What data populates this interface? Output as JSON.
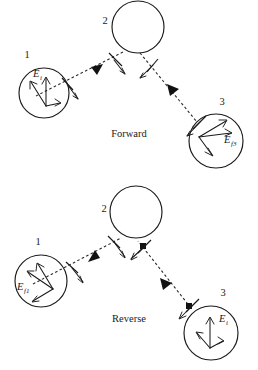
{
  "figure": {
    "title_absent": true,
    "background_color": "#ffffff",
    "line_color": "#1a1a1a",
    "dash_color": "#2b2b2b",
    "panels": [
      {
        "id": "forward",
        "caption": "Forward",
        "caption_pos": {
          "x": 129,
          "y": 137
        },
        "nodes": [
          {
            "id": "n1",
            "label": "1",
            "label_pos": {
              "x": 27,
              "y": 58
            },
            "cx": 44,
            "cy": 93,
            "r": 25,
            "field_label": {
              "base": "E",
              "sub": "i",
              "x": 33,
              "y": 77
            }
          },
          {
            "id": "n2",
            "label": "2",
            "label_pos": {
              "x": 105,
              "y": 24
            },
            "cx": 138,
            "cy": 27,
            "r": 26,
            "field_label": null
          },
          {
            "id": "n3",
            "label": "3",
            "label_pos": {
              "x": 222,
              "y": 105
            },
            "cx": 216,
            "cy": 141,
            "r": 27,
            "field_label": {
              "base": "E",
              "sub": "f3",
              "x": 228,
              "y": 140
            }
          }
        ],
        "rays": [
          {
            "from": "n2",
            "to": "n1",
            "direction": "toward-node-1"
          },
          {
            "from": "n2",
            "to": "n3",
            "direction": "toward-node-3"
          }
        ]
      },
      {
        "id": "reverse",
        "caption": "Reverse",
        "caption_pos": {
          "x": 129,
          "y": 322
        },
        "nodes": [
          {
            "id": "r1",
            "label": "1",
            "label_pos": {
              "x": 38,
              "y": 245
            },
            "cx": 41,
            "cy": 281,
            "r": 26,
            "field_label": {
              "base": "E",
              "sub": "f1",
              "x": 20,
              "y": 288
            }
          },
          {
            "id": "r2",
            "label": "2",
            "label_pos": {
              "x": 104,
              "y": 212
            },
            "cx": 136,
            "cy": 212,
            "r": 26,
            "field_label": null
          },
          {
            "id": "r3",
            "label": "3",
            "label_pos": {
              "x": 223,
              "y": 296
            },
            "cx": 211,
            "cy": 333,
            "r": 27,
            "field_label": {
              "base": "E",
              "sub": "i",
              "x": 222,
              "y": 320
            }
          }
        ],
        "rays": [
          {
            "from": "r1",
            "to": "r2",
            "direction": "toward-node-2"
          },
          {
            "from": "r3",
            "to": "r2",
            "direction": "toward-node-2"
          }
        ]
      }
    ]
  }
}
